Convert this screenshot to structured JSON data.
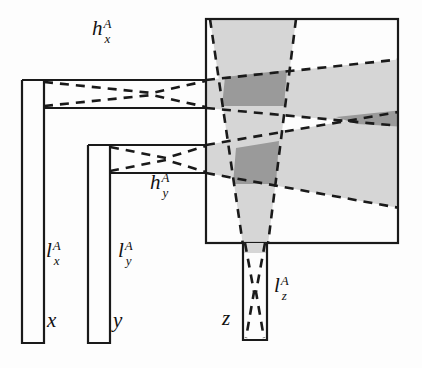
{
  "figure": {
    "kind": "optical-cone-diagram"
  },
  "labels": {
    "h_x": {
      "base": "h",
      "sup": "A",
      "sub": "x",
      "x": 92,
      "y": 18
    },
    "h_y": {
      "base": "h",
      "sup": "A",
      "sub": "y",
      "x": 150,
      "y": 172
    },
    "l_x": {
      "base": "l",
      "sup": "A",
      "sub": "x",
      "x": 44,
      "y": 240
    },
    "l_y": {
      "base": "l",
      "sup": "A",
      "sub": "y",
      "x": 118,
      "y": 240
    },
    "l_z": {
      "base": "l",
      "sup": "A",
      "sub": "z",
      "x": 272,
      "y": 275
    }
  },
  "axis_marks": {
    "x": {
      "text": "x",
      "x": 47,
      "y": 314
    },
    "y": {
      "text": "y",
      "x": 113,
      "y": 314
    },
    "z": {
      "text": "z",
      "x": 221,
      "y": 312
    }
  },
  "colors": {
    "stroke": "#1a1a1a",
    "cone_light": "#d6d6d6",
    "cone_dark": "#9a9a9a",
    "background": "#fdfdfd",
    "dash": "#1a1a1a"
  },
  "geometry": {
    "box": {
      "x": 206,
      "y": 19,
      "width": 192,
      "height": 224
    },
    "channel_x": {
      "x": 22,
      "y": 80,
      "width": 184,
      "height": 28
    },
    "channel_y": {
      "x": 88,
      "y": 145,
      "width": 118,
      "height": 28
    },
    "channel_z": {
      "x": 243,
      "y": 243,
      "width": 24,
      "height": 97
    },
    "leg_x": {
      "x": 22,
      "y": 80,
      "width": 22,
      "height": 263
    },
    "leg_y": {
      "x": 88,
      "y": 145,
      "width": 22,
      "height": 198
    }
  },
  "strokes": {
    "solid_width": 2.0,
    "dash_width": 2.6,
    "dash_pattern": "9 7"
  }
}
